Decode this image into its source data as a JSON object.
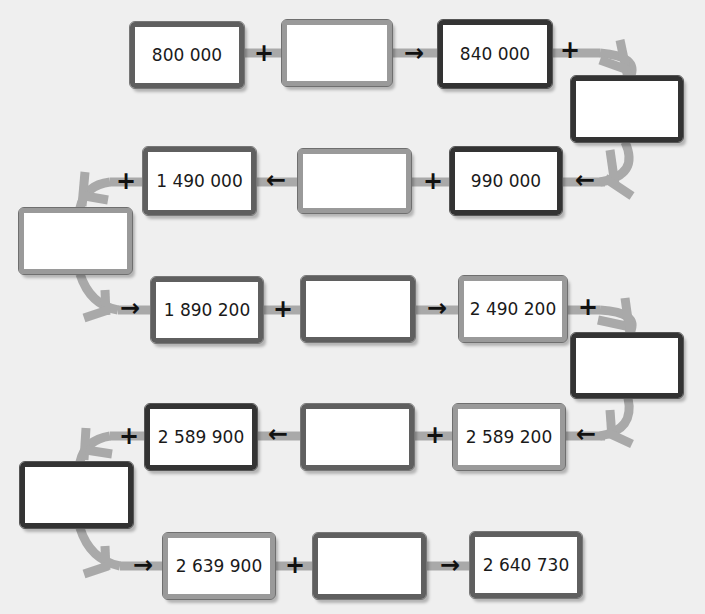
{
  "diagram": {
    "type": "addition-chain",
    "rows": [
      {
        "direction": "right",
        "items": [
          {
            "id": "r1b1",
            "value": "800 000"
          },
          {
            "op": "+"
          },
          {
            "id": "r1b2",
            "value": ""
          },
          {
            "op": "→"
          },
          {
            "id": "r1b3",
            "value": "840 000"
          },
          {
            "op": "+"
          }
        ]
      },
      {
        "turn": "right",
        "id": "t1",
        "value": ""
      },
      {
        "direction": "left",
        "items": [
          {
            "op": "←"
          },
          {
            "id": "r2b3",
            "value": "990 000"
          },
          {
            "op": "+"
          },
          {
            "id": "r2b2",
            "value": ""
          },
          {
            "op": "←"
          },
          {
            "id": "r2b1",
            "value": "1 490 000"
          },
          {
            "op": "+"
          }
        ]
      },
      {
        "turn": "left",
        "id": "t2",
        "value": ""
      },
      {
        "direction": "right",
        "items": [
          {
            "op": "→"
          },
          {
            "id": "r3b1",
            "value": "1 890 200"
          },
          {
            "op": "+"
          },
          {
            "id": "r3b2",
            "value": ""
          },
          {
            "op": "→"
          },
          {
            "id": "r3b3",
            "value": "2 490 200"
          },
          {
            "op": "+"
          }
        ]
      },
      {
        "turn": "right",
        "id": "t3",
        "value": ""
      },
      {
        "direction": "left",
        "items": [
          {
            "op": "←"
          },
          {
            "id": "r4b3",
            "value": "2 589 200"
          },
          {
            "op": "+"
          },
          {
            "id": "r4b2",
            "value": ""
          },
          {
            "op": "←"
          },
          {
            "id": "r4b1",
            "value": "2 589 900"
          },
          {
            "op": "+"
          }
        ]
      },
      {
        "turn": "left",
        "id": "t4",
        "value": ""
      },
      {
        "direction": "right",
        "items": [
          {
            "op": "→"
          },
          {
            "id": "r5b1",
            "value": "2 639 900"
          },
          {
            "op": "+"
          },
          {
            "id": "r5b2",
            "value": ""
          },
          {
            "op": "→"
          },
          {
            "id": "r5b3",
            "value": "2 640 730"
          }
        ]
      }
    ]
  },
  "boxes": {
    "r1b1": "800 000",
    "r1b2": "",
    "r1b3": "840 000",
    "t1": "",
    "r2b3": "990 000",
    "r2b2": "",
    "r2b1": "1 490 000",
    "t2": "",
    "r3b1": "1 890 200",
    "r3b2": "",
    "r3b3": "2 490 200",
    "t3": "",
    "r4b3": "2 589 200",
    "r4b2": "",
    "r4b1": "2 589 900",
    "t4": "",
    "r5b1": "2 639 900",
    "r5b2": "",
    "r5b3": "2 640 730"
  },
  "symbols": {
    "plus": "+",
    "arrow_right": "→",
    "arrow_left": "←"
  },
  "colors": {
    "background": "#efefef",
    "path": "#a8a8a8",
    "border_dark": "#333333",
    "border_mid": "#5f5f5f",
    "border_light": "#9a9a9a"
  }
}
